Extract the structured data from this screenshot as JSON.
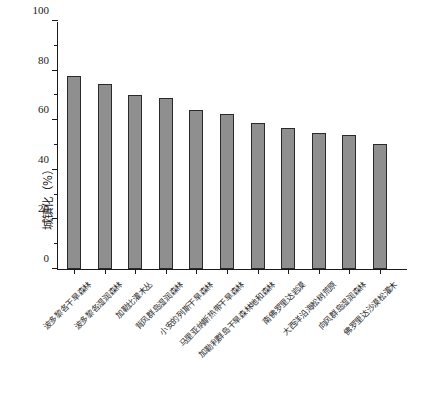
{
  "chart_data": {
    "type": "bar",
    "title": "",
    "xlabel": "",
    "ylabel": "城镇化（%）",
    "ylim": [
      0,
      100
    ],
    "yticks": [
      0,
      20,
      40,
      60,
      80,
      100
    ],
    "ytick_labels": [
      "0",
      "20",
      "40",
      "60",
      "80",
      "100"
    ],
    "grid": false,
    "legend": "none",
    "bar_color": "#8f8f8f",
    "bar_edge_color": "#2a2a2a",
    "axis_color": "#1a1a1a",
    "categories": [
      "波多黎各干旱森林",
      "波多黎各湿润森林",
      "加勒比灌木丛",
      "背风群岛湿润森林",
      "小安的列斯干旱森林",
      "马里亚纳斯热带干旱森林",
      "加勒利群岛干旱森林地和森林",
      "南佛罗里达岩漠",
      "大西洋沿海松树荒原",
      "向风群岛湿润森林",
      "佛罗里达沙漠松灌木"
    ],
    "values": [
      78,
      74.5,
      70,
      69,
      64,
      62.5,
      59,
      57,
      55,
      54,
      50.5
    ]
  },
  "caption": {
    "cropped_text": ""
  }
}
